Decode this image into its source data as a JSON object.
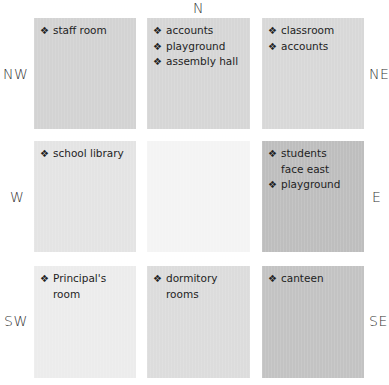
{
  "compass": {
    "n": "N",
    "nw": "NW",
    "ne": "NE",
    "w": "W",
    "e": "E",
    "sw": "SW",
    "se": "SE"
  },
  "bullet_icon": "❖",
  "cells": {
    "nw": {
      "color": "#d3d3d3",
      "items": [
        "staff room"
      ]
    },
    "n": {
      "color": "#d6d6d6",
      "items": [
        "accounts",
        "playground",
        "assembly hall"
      ]
    },
    "ne": {
      "color": "#d8d8d8",
      "items": [
        "classroom",
        "accounts"
      ]
    },
    "w": {
      "color": "#e4e4e4",
      "items": [
        "school library"
      ]
    },
    "c": {
      "color": "#f4f4f4",
      "items": []
    },
    "e": {
      "color": "#bebebe",
      "items": [
        "students face east",
        "playground"
      ]
    },
    "sw": {
      "color": "#ececec",
      "items": [
        "Principal's room"
      ]
    },
    "s": {
      "color": "#dcdcdc",
      "items": [
        "dormitory rooms"
      ]
    },
    "se": {
      "color": "#c3c3c3",
      "items": [
        "canteen"
      ]
    }
  }
}
